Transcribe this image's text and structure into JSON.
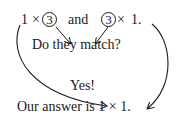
{
  "diagram": {
    "line1": {
      "left_factor": "1",
      "times": "×",
      "left_circled": "3",
      "conjunction": "and",
      "right_circled": "3",
      "right_times": "×",
      "right_factor": "1."
    },
    "question": "Do they match?",
    "answer": "Yes!",
    "conclusion": "Our answer is 1 × 1.",
    "colors": {
      "ink": "#1a1a1a",
      "background": "#ffffff"
    }
  }
}
